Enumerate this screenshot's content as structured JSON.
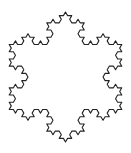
{
  "figure": {
    "type": "koch-snowflake",
    "iterations": 3,
    "center": [
      65.5,
      77
    ],
    "radius": 65,
    "rotation_deg": -90,
    "stroke_color": "#222222",
    "fill_color": "#ffffff",
    "stroke_width": 1.1,
    "background": "#ffffff"
  }
}
